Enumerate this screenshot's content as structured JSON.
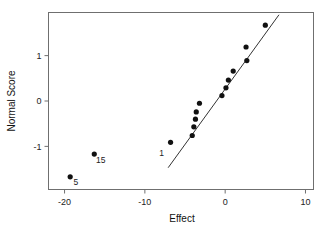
{
  "chart_data": {
    "type": "scatter",
    "title": "",
    "xlabel": "Effect",
    "ylabel": "Normal Score",
    "xlim": [
      -22,
      11
    ],
    "ylim": [
      -1.95,
      1.95
    ],
    "grid": false,
    "legend": "none",
    "xticks": [
      -20,
      -10,
      0,
      10
    ],
    "xticklabels": [
      "-20",
      "-10",
      "0",
      "10"
    ],
    "yticks": [
      -1,
      0,
      1
    ],
    "yticklabels": [
      "-1",
      "0",
      "1"
    ],
    "series": [
      {
        "name": "effects",
        "marker": "filled-circle",
        "color": "#111111",
        "points": [
          {
            "x": -19.3,
            "y": -1.67,
            "label": "5"
          },
          {
            "x": -16.3,
            "y": -1.17,
            "label": "15"
          },
          {
            "x": -6.8,
            "y": -0.91,
            "label": "1"
          },
          {
            "x": -4.1,
            "y": -0.76,
            "label": ""
          },
          {
            "x": -3.9,
            "y": -0.57,
            "label": ""
          },
          {
            "x": -3.7,
            "y": -0.4,
            "label": ""
          },
          {
            "x": -3.6,
            "y": -0.24,
            "label": ""
          },
          {
            "x": -3.2,
            "y": -0.05,
            "label": ""
          },
          {
            "x": -0.4,
            "y": 0.12,
            "label": ""
          },
          {
            "x": 0.1,
            "y": 0.29,
            "label": ""
          },
          {
            "x": 0.4,
            "y": 0.46,
            "label": ""
          },
          {
            "x": 1.0,
            "y": 0.66,
            "label": ""
          },
          {
            "x": 2.7,
            "y": 0.89,
            "label": ""
          },
          {
            "x": 2.6,
            "y": 1.19,
            "label": ""
          },
          {
            "x": 5.0,
            "y": 1.67,
            "label": ""
          }
        ]
      }
    ],
    "reference_line": {
      "name": "normal-reference-line",
      "color": "#333333",
      "x1": -7.1,
      "y1": -1.47,
      "x2": 6.7,
      "y2": 1.9
    },
    "annotations": [
      {
        "text": "5",
        "x": -18.6,
        "y": -1.85
      },
      {
        "text": "15",
        "x": -15.5,
        "y": -1.37
      },
      {
        "text": "1",
        "x": -7.9,
        "y": -1.21
      }
    ]
  },
  "axes": {
    "x_title": "Effect",
    "y_title": "Normal Score"
  }
}
